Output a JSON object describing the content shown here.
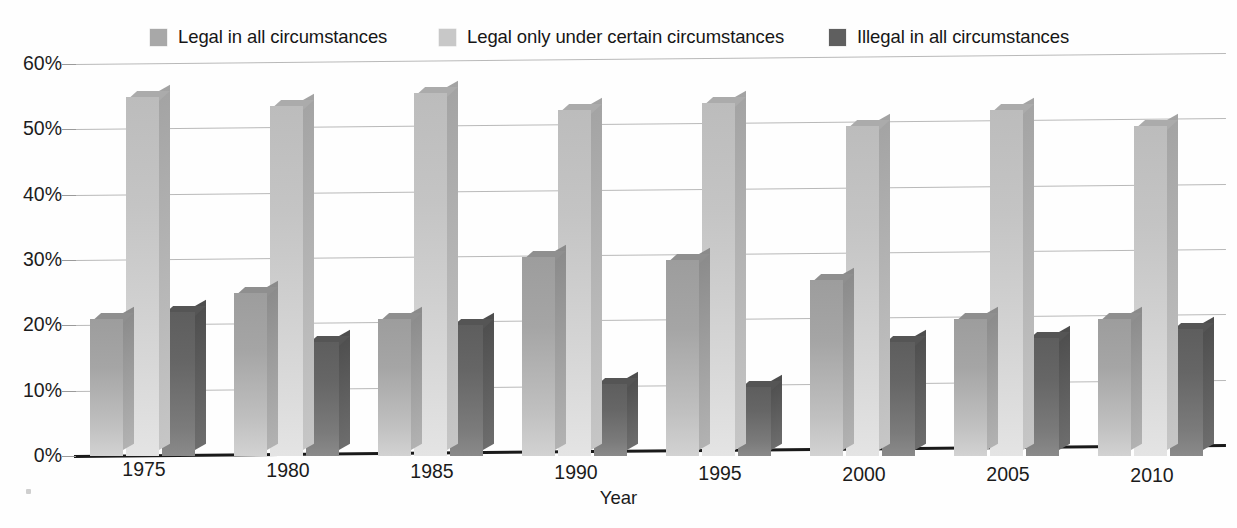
{
  "chart_data": {
    "type": "bar",
    "title": "",
    "subtitle": "",
    "xlabel": "Year",
    "ylabel": "",
    "categories": [
      "1975",
      "1980",
      "1985",
      "1990",
      "1995",
      "2000",
      "2005",
      "2010"
    ],
    "series": [
      {
        "name": "Legal in all circumstances",
        "color": "#a8a8a8",
        "values": [
          21,
          25,
          21,
          30.5,
          30,
          27,
          21,
          21
        ]
      },
      {
        "name": "Legal only under certain circumstances",
        "color": "#c8c8c8",
        "values": [
          55,
          53.5,
          55.5,
          53,
          54,
          50.5,
          53,
          50.5
        ]
      },
      {
        "name": "Illegal in all circumstances",
        "color": "#5f5f5f",
        "values": [
          22,
          17.5,
          20,
          11,
          10.5,
          17.5,
          18,
          19.5
        ]
      }
    ],
    "ylim": [
      0,
      60
    ],
    "yticks": [
      "0%",
      "10%",
      "20%",
      "30%",
      "40%",
      "50%",
      "60%"
    ],
    "ytick_values": [
      0,
      10,
      20,
      30,
      40,
      50,
      60
    ],
    "grid": true,
    "legend_position": "top",
    "value_suffix": "%"
  },
  "legend": {
    "items": [
      {
        "label": "Legal in all circumstances",
        "swatch": "#a8a8a8"
      },
      {
        "label": "Legal only under certain circumstances",
        "swatch": "#c8c8c8"
      },
      {
        "label": "Illegal in all circumstances",
        "swatch": "#5f5f5f"
      }
    ]
  },
  "axes": {
    "x_title": "Year",
    "y_ticks": [
      "60%",
      "50%",
      "40%",
      "30%",
      "20%",
      "10%",
      "0%"
    ],
    "x_ticks": [
      "1975",
      "1980",
      "1985",
      "1990",
      "1995",
      "2000",
      "2005",
      "2010"
    ]
  }
}
